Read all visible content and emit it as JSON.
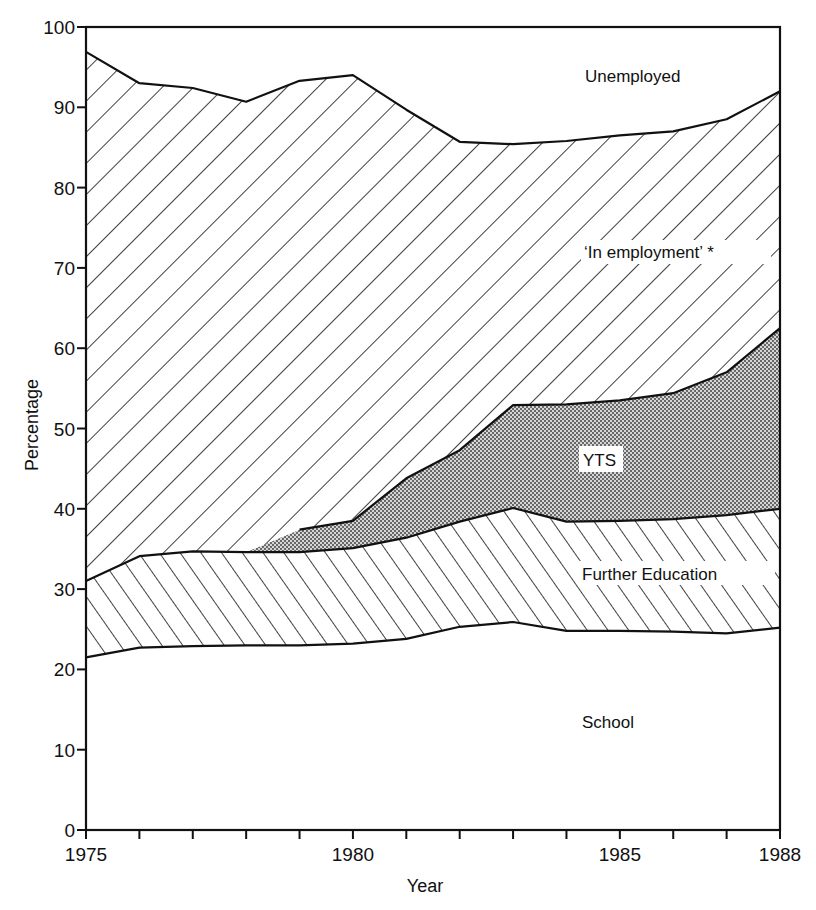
{
  "chart_data": {
    "type": "area",
    "stacked": true,
    "title": "",
    "xlabel": "Year",
    "ylabel": "Percentage",
    "x": [
      1975,
      1976,
      1977,
      1978,
      1979,
      1980,
      1981,
      1982,
      1983,
      1984,
      1985,
      1986,
      1987,
      1988
    ],
    "x_tick_labels": [
      "1975",
      "1980",
      "1985",
      "1988"
    ],
    "x_minor_ticks": [
      1975,
      1976,
      1977,
      1978,
      1979,
      1980,
      1981,
      1982,
      1983,
      1984,
      1985,
      1986,
      1987,
      1988
    ],
    "y_tick_labels": [
      "0",
      "10",
      "20",
      "30",
      "40",
      "50",
      "60",
      "70",
      "80",
      "90",
      "100"
    ],
    "xlim": [
      1975,
      1988
    ],
    "ylim": [
      0,
      100
    ],
    "grid": false,
    "legend": "none (regions labelled directly)",
    "series": [
      {
        "name": "School",
        "pattern": "blank",
        "values": [
          21.5,
          22.7,
          22.9,
          23.0,
          23.0,
          23.2,
          23.8,
          25.3,
          25.9,
          24.8,
          24.8,
          24.7,
          24.5,
          25.2
        ]
      },
      {
        "name": "Further Education",
        "pattern": "forward-diagonal-hatch",
        "values": [
          9.5,
          11.4,
          11.8,
          11.6,
          11.6,
          11.9,
          12.6,
          13.1,
          14.2,
          13.6,
          13.7,
          14.0,
          14.7,
          14.8
        ]
      },
      {
        "name": "YTS",
        "pattern": "stipple-grey",
        "values": [
          0.0,
          0.0,
          0.0,
          0.0,
          2.8,
          3.4,
          7.4,
          8.9,
          12.8,
          14.6,
          15.0,
          15.7,
          17.8,
          22.5
        ]
      },
      {
        "name": "'In employment' *",
        "pattern": "back-diagonal-hatch",
        "values": [
          65.9,
          58.9,
          57.7,
          56.1,
          55.9,
          55.5,
          45.9,
          38.4,
          32.5,
          32.8,
          33.0,
          32.6,
          31.5,
          29.5
        ]
      },
      {
        "name": "Unemployed",
        "pattern": "blank",
        "values": [
          3.1,
          7.0,
          7.6,
          9.3,
          6.7,
          6.0,
          10.3,
          14.3,
          14.6,
          14.2,
          13.5,
          13.0,
          11.5,
          8.0
        ]
      }
    ],
    "cumulative_boundaries": {
      "school_top": [
        21.5,
        22.7,
        22.9,
        23.0,
        23.0,
        23.2,
        23.8,
        25.3,
        25.9,
        24.8,
        24.8,
        24.7,
        24.5,
        25.2
      ],
      "further_education_top": [
        31.0,
        34.1,
        34.7,
        34.6,
        34.6,
        35.1,
        36.4,
        38.4,
        40.1,
        38.4,
        38.5,
        38.7,
        39.2,
        40.0
      ],
      "yts_top": [
        31.0,
        34.1,
        34.7,
        34.6,
        37.4,
        38.5,
        43.8,
        47.3,
        52.9,
        53.0,
        53.5,
        54.4,
        57.0,
        62.5
      ],
      "employment_top": [
        96.9,
        93.0,
        92.4,
        90.7,
        93.3,
        94.0,
        89.7,
        85.7,
        85.4,
        85.8,
        86.5,
        87.0,
        88.5,
        92.0
      ]
    },
    "annotations": [
      {
        "text": "Unemployed",
        "x": 1985.0,
        "y": 94.5
      },
      {
        "text": "'In employment' *",
        "x": 1985.0,
        "y": 72.5
      },
      {
        "text": "YTS",
        "x": 1984.8,
        "y": 46.0
      },
      {
        "text": "Further Education",
        "x": 1985.3,
        "y": 31.5
      },
      {
        "text": "School",
        "x": 1985.0,
        "y": 13.5
      }
    ]
  },
  "labels": {
    "xlabel": "Year",
    "ylabel": "Percentage",
    "unemployed": "Unemployed",
    "employment": "‘In employment’ *",
    "yts": "YTS",
    "further_education": "Further Education",
    "school": "School"
  },
  "colors": {
    "ink": "#111111",
    "background": "#ffffff",
    "stipple": "#9a9a9a"
  }
}
